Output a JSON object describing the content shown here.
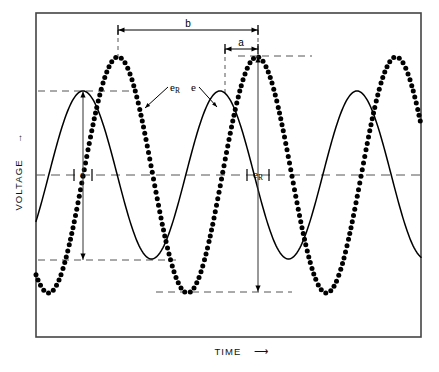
{
  "figure": {
    "type": "waveform-diagram",
    "background": "#ffffff",
    "ink": "#111111",
    "frame": {
      "x": 36,
      "y": 13,
      "width": 385,
      "height": 324,
      "stroke": "#444444",
      "stroke_width": 1.6
    }
  },
  "axes": {
    "y_label": "VOLTAGE",
    "y_arrow": "→",
    "x_label": "TIME",
    "x_arrow": "⟶",
    "x_label_pos": {
      "x": 228,
      "y": 355
    },
    "y_label_pos": {
      "x": 22,
      "y": 185
    }
  },
  "chart_data": {
    "type": "line",
    "title": "",
    "xlabel": "TIME",
    "ylabel": "VOLTAGE",
    "grid": false,
    "legend": "inline-annotations",
    "xlim": [
      36,
      421
    ],
    "ylim_px": [
      13,
      337
    ],
    "baseline_y": 175,
    "series": [
      {
        "name": "e",
        "label": "e",
        "style": "solid",
        "stroke": "#000000",
        "stroke_width": 1.5,
        "amplitude_px": 84,
        "period_px": 137,
        "peak_x_px": 83,
        "center_y_px": 175,
        "peaks_x_px": [
          83,
          220,
          357
        ],
        "troughs_x_px": [
          151,
          288
        ],
        "peak_y_px": 91,
        "trough_y_px": 260
      },
      {
        "name": "eR",
        "label": "e",
        "label_sub": "R",
        "style": "dotted",
        "stroke": "#000000",
        "dot_radius": 2.5,
        "dot_spacing_px": 5.6,
        "amplitude_px": 118,
        "period_px": 139,
        "peak_x_px": 118,
        "center_y_px": 175,
        "peaks_x_px": [
          118,
          258,
          397
        ],
        "troughs_x_px": [
          188,
          327
        ],
        "peak_y_px": 56,
        "trough_y_px": 292
      }
    ]
  },
  "annotations": {
    "dimensions": [
      {
        "name": "b",
        "label": "b",
        "x1": 118,
        "x2": 258,
        "y": 30,
        "label_x": 188,
        "label_y": 27
      },
      {
        "name": "a",
        "label": "a",
        "x1": 225,
        "x2": 258,
        "y": 49,
        "label_x": 241,
        "label_y": 46
      }
    ],
    "amplitude_arrows": [
      {
        "name": "e-amplitude",
        "x": 83,
        "y1": 91,
        "y2": 260
      },
      {
        "name": "eR-amplitude",
        "x": 258,
        "y1": 56,
        "y2": 292
      }
    ],
    "instant_markers": [
      {
        "name": "e-instant",
        "label": "e",
        "x": 83,
        "y": 175,
        "label_x": 83,
        "label_y": 178,
        "half_width": 9
      },
      {
        "name": "eR-instant",
        "label": "e",
        "label_sub": "R",
        "x": 258,
        "y": 175,
        "label_x": 256,
        "label_y": 178,
        "half_width": 11
      }
    ],
    "leaders": [
      {
        "name": "eR-leader",
        "label": "e",
        "label_sub": "R",
        "from_x": 168,
        "from_y": 87,
        "to_x": 145,
        "to_y": 108,
        "label_x": 170,
        "label_y": 91
      },
      {
        "name": "e-leader",
        "label": "e",
        "from_x": 199,
        "from_y": 87,
        "to_x": 217,
        "to_y": 107,
        "label_x": 191,
        "label_y": 91
      }
    ],
    "reference_lines": [
      {
        "name": "e-peak-ref",
        "x1": 38,
        "x2": 136,
        "y": 91,
        "dash": "7,5"
      },
      {
        "name": "e-trough-ref",
        "x1": 38,
        "x2": 176,
        "y": 260,
        "dash": "7,5"
      },
      {
        "name": "eR-peak-ref",
        "x1": 238,
        "x2": 312,
        "y": 56,
        "dash": "7,5"
      },
      {
        "name": "eR-trough-ref",
        "x1": 156,
        "x2": 292,
        "y": 292,
        "dash": "7,5"
      },
      {
        "name": "center-axis",
        "x1": 36,
        "x2": 421,
        "y": 175,
        "dash": "9,6"
      }
    ],
    "drop_lines": [
      {
        "name": "b-left-drop",
        "x": 118,
        "y1": 30,
        "y2": 62,
        "dash": "4,4"
      },
      {
        "name": "b-right-drop",
        "x": 258,
        "y1": 30,
        "y2": 56,
        "dash": "4,4"
      },
      {
        "name": "a-left-drop",
        "x": 225,
        "y1": 49,
        "y2": 96,
        "dash": "4,4"
      }
    ]
  }
}
